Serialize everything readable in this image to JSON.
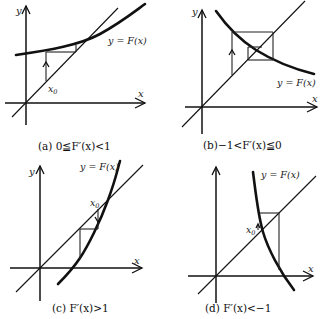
{
  "figure": {
    "panels": [
      {
        "id": "a",
        "caption": "(a) 0≦F′(x)<1",
        "curve_label": "y = F(x)",
        "x_axis_label": "x",
        "y_axis_label": "y",
        "start_label": "x",
        "start_label_sub": "0",
        "behavior": "monotone convergence"
      },
      {
        "id": "b",
        "caption": "(b)−1<F′(x)≦0",
        "curve_label": "y = F(x)",
        "x_axis_label": "x",
        "y_axis_label": "y",
        "behavior": "oscillating convergence"
      },
      {
        "id": "c",
        "caption": "(c)  F′(x)>1",
        "curve_label": "y = F(x)",
        "x_axis_label": "x",
        "y_axis_label": "y",
        "start_label": "x",
        "start_label_sub": "0",
        "behavior": "monotone divergence"
      },
      {
        "id": "d",
        "caption": "(d)  F′(x)<−1",
        "curve_label": "y = F(x)",
        "x_axis_label": "x",
        "y_axis_label": "",
        "start_label": "x",
        "start_label_sub": "0",
        "behavior": "oscillating divergence"
      }
    ]
  }
}
